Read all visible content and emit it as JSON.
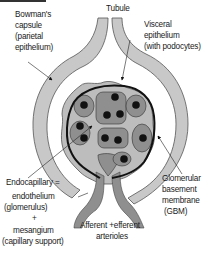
{
  "diagram": {
    "labels": {
      "tubule": "Tubule",
      "bowmans_capsule": [
        "Bowman's",
        "capsule",
        "(parietal",
        "epithelium)"
      ],
      "visceral_epithelium": [
        "Visceral",
        "epithelium",
        "(with podocytes)"
      ],
      "endocapillary": "Endocapillary =",
      "endothelium": [
        "endothelium",
        "(glomerulus)"
      ],
      "plus": "+",
      "mesangium": [
        "mesangium",
        "(capillary support)"
      ],
      "gbm": [
        "Glomerular",
        "basement",
        "membrane",
        "(GBM)"
      ],
      "arterioles": [
        "Afferent +efferent",
        "arterioles"
      ]
    },
    "colors": {
      "capsule_fill": "#c8c8c8",
      "visceral_fill": "#bdbdbd",
      "capillary_fill": "#8f8f8f",
      "nucleus": "#111111",
      "membrane": "#111111",
      "outline": "#555555",
      "background": "#ffffff"
    }
  }
}
